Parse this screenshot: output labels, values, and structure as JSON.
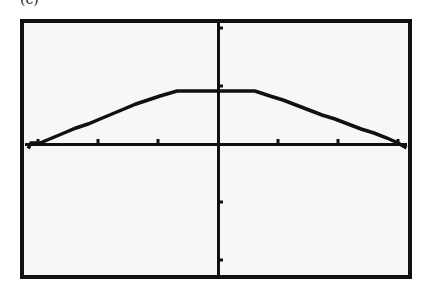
{
  "caption": {
    "visible_fragment": "(c)"
  },
  "colors": {
    "ink": "#111111",
    "screen_bg": "#f7f7f5",
    "page_bg": "#ffffff"
  },
  "chart_data": {
    "type": "line",
    "title": "",
    "xlabel": "",
    "ylabel": "",
    "grid": false,
    "xtick_spacing": 1,
    "ytick_spacing": 1,
    "xlim": [
      -3.3,
      3.3
    ],
    "ylim": [
      -2.2,
      2.2
    ],
    "x": [
      -3.0,
      -2.0,
      -1.0,
      -0.7,
      0.0,
      0.6,
      1.0,
      2.0,
      3.0
    ],
    "y": [
      0.0,
      0.35,
      0.72,
      0.9,
      0.9,
      0.9,
      0.72,
      0.35,
      0.0
    ],
    "xticks": [
      -3,
      -2,
      -1,
      1,
      2,
      3
    ],
    "yticks": [
      -2,
      -1,
      1,
      2
    ]
  },
  "plot_px": {
    "origin": [
      218,
      144
    ],
    "x_unit_px": 60,
    "y_unit_px": 58,
    "curve_points": "29,147 31,143 40,143 52,138 64,133 76,128 88,124 100,119 112,114 124,109 136,104 148,100 160,96 177,91 255,91 270,96 283,100 296,105 309,110 322,115 335,119 348,124 361,129 374,133 387,138 398,143 405,147"
  }
}
